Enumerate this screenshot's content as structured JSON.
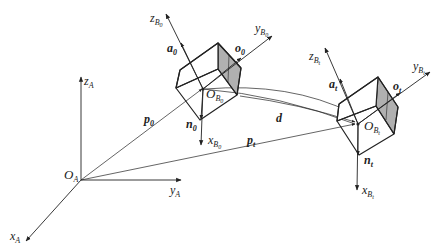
{
  "diagram": {
    "type": "3d-coordinate-frames",
    "world_frame": {
      "origin": {
        "main": "O",
        "sub": "A"
      },
      "axes": {
        "z": {
          "main": "z",
          "sub": "A"
        },
        "y": {
          "main": "y",
          "sub": "A"
        },
        "x": {
          "main": "x",
          "sub": "A"
        }
      }
    },
    "body_frame_0": {
      "origin": {
        "main": "O",
        "sub": "B",
        "subsub": "0"
      },
      "axes": {
        "z": {
          "main": "z",
          "sub": "B",
          "subsub": "0"
        },
        "y": {
          "main": "y",
          "sub": "B",
          "subsub": "0"
        },
        "x": {
          "main": "x",
          "sub": "B",
          "subsub": "0"
        }
      },
      "vectors": {
        "a": {
          "main": "a",
          "sub": "0"
        },
        "o": {
          "main": "o",
          "sub": "0"
        },
        "n": {
          "main": "n",
          "sub": "0"
        }
      }
    },
    "body_frame_t": {
      "origin": {
        "main": "O",
        "sub": "B",
        "subsub": "t"
      },
      "axes": {
        "z": {
          "main": "z",
          "sub": "B",
          "subsub": "t"
        },
        "y": {
          "main": "y",
          "sub": "B",
          "subsub": "t"
        },
        "x": {
          "main": "x",
          "sub": "B",
          "subsub": "t"
        }
      },
      "vectors": {
        "a": {
          "main": "a",
          "sub": "t"
        },
        "o": {
          "main": "o",
          "sub": "t"
        },
        "n": {
          "main": "n",
          "sub": "t"
        }
      }
    },
    "position_vectors": {
      "p0": {
        "main": "p",
        "sub": "0"
      },
      "pt": {
        "main": "p",
        "sub": "t"
      },
      "d": {
        "main": "d"
      }
    },
    "colors": {
      "line": "#222222",
      "shaded_face": "#b0b0b0",
      "background": "#ffffff"
    }
  }
}
